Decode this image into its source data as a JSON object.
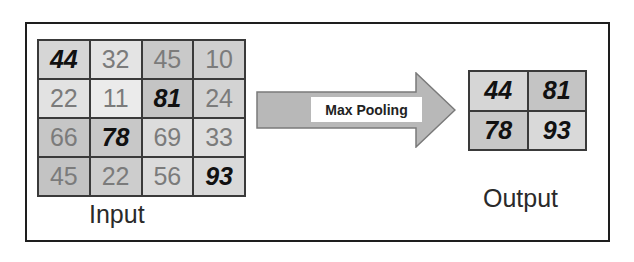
{
  "input": {
    "label": "Input",
    "rows": [
      [
        {
          "v": "44",
          "max": true,
          "bg": "#d6d6d6"
        },
        {
          "v": "32",
          "max": false,
          "bg": "#e4e4e4"
        },
        {
          "v": "45",
          "max": false,
          "bg": "#c9c9c9"
        },
        {
          "v": "10",
          "max": false,
          "bg": "#cfcfcf"
        }
      ],
      [
        {
          "v": "22",
          "max": false,
          "bg": "#e2e2e2"
        },
        {
          "v": "11",
          "max": false,
          "bg": "#ebebeb"
        },
        {
          "v": "81",
          "max": true,
          "bg": "#c4c4c4"
        },
        {
          "v": "24",
          "max": false,
          "bg": "#d3d3d3"
        }
      ],
      [
        {
          "v": "66",
          "max": false,
          "bg": "#c6c6c6"
        },
        {
          "v": "78",
          "max": true,
          "bg": "#c8c8c8"
        },
        {
          "v": "69",
          "max": false,
          "bg": "#dcdcdc"
        },
        {
          "v": "33",
          "max": false,
          "bg": "#dedede"
        }
      ],
      [
        {
          "v": "45",
          "max": false,
          "bg": "#c3c3c3"
        },
        {
          "v": "22",
          "max": false,
          "bg": "#cdcdcd"
        },
        {
          "v": "56",
          "max": false,
          "bg": "#dbdbdb"
        },
        {
          "v": "93",
          "max": true,
          "bg": "#d9d9d9"
        }
      ]
    ]
  },
  "operation": {
    "label": "Max Pooling"
  },
  "output": {
    "label": "Output",
    "rows": [
      [
        {
          "v": "44",
          "max": true,
          "bg": "#d6d6d6"
        },
        {
          "v": "81",
          "max": true,
          "bg": "#c4c4c4"
        }
      ],
      [
        {
          "v": "78",
          "max": true,
          "bg": "#c8c8c8"
        },
        {
          "v": "93",
          "max": true,
          "bg": "#d9d9d9"
        }
      ]
    ]
  },
  "colors": {
    "arrow_fill": "#b8b8b8",
    "arrow_stroke": "#7a7a7a",
    "max_text": "#111111",
    "normal_text": "#7b7b7b"
  }
}
